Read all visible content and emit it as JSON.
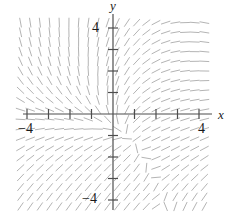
{
  "figure": {
    "type": "slope-field",
    "background_color": "#ffffff",
    "width": 237,
    "height": 217
  },
  "axes": {
    "x_axis_label": "x",
    "y_axis_label": "y",
    "axis_color": "#4d4d4d",
    "origin_px": {
      "x": 113,
      "y": 114
    },
    "unit_px": 21.5,
    "x_axis_line": {
      "x1": 23,
      "x2": 212,
      "y": 114
    },
    "y_axis_line": {
      "y1": 14,
      "y2": 210,
      "x": 113
    },
    "tick_values": [
      -4,
      -3,
      -2,
      -1,
      1,
      2,
      3,
      4
    ],
    "tick_half_len_px": 5,
    "x_tick_labels": [
      {
        "value": -4,
        "text": "−4"
      },
      {
        "value": 4,
        "text": "4"
      }
    ],
    "y_tick_labels": [
      {
        "value": 4,
        "text": "4"
      },
      {
        "value": -4,
        "text": "−4"
      }
    ]
  },
  "chart_data": {
    "type": "scatter",
    "title": "",
    "xlabel": "x",
    "ylabel": "y",
    "xlim": [
      -4.6,
      4.6
    ],
    "ylim": [
      -4.6,
      4.6
    ],
    "grid": false,
    "legend": null,
    "plot_kind": "slope field (direction field) of a first-order ODE",
    "segment_color": "#b4b4b4",
    "segment_width": 1.0,
    "segment_length_px": 9,
    "sample_step": 0.45,
    "sample_x_range": [
      -4.3,
      4.3
    ],
    "sample_y_range": [
      -4.3,
      4.3
    ],
    "slope_model": {
      "description": "dy/dx approximated by a field that is near-vertical in the upper-left, near-horizontal in the lower-right, with a saddle-like feature in the upper-right quadrant near (2.6, 2.9)",
      "formula": "dy/dx = (y - 0.35*x*y + 0.9) / (x + 0.55*y - 0.2) with soft clipping",
      "saddle_point": [
        2.6,
        2.9
      ]
    },
    "qualitative_regions": [
      {
        "region": "upper-left",
        "x": [
          -4.3,
          -0.3
        ],
        "y": [
          0.3,
          4.3
        ],
        "typical_slope": "steep / near-vertical, tilted slightly left"
      },
      {
        "region": "upper-right",
        "x": [
          0.3,
          4.3
        ],
        "y": [
          0.3,
          4.3
        ],
        "typical_slope": "saddle structure: curves bend around (2.6, 2.9)"
      },
      {
        "region": "lower-left",
        "x": [
          -4.3,
          -0.3
        ],
        "y": [
          -4.3,
          -0.3
        ],
        "typical_slope": "positive, about +1 (45 degrees up to the right)"
      },
      {
        "region": "lower-right",
        "x": [
          0.3,
          4.3
        ],
        "y": [
          -4.3,
          -0.3
        ],
        "typical_slope": "shallow / near-horizontal"
      },
      {
        "region": "near-origin",
        "x": [
          -0.6,
          0.6
        ],
        "y": [
          -0.6,
          0.6
        ],
        "typical_slope": "moderate positive"
      }
    ]
  }
}
